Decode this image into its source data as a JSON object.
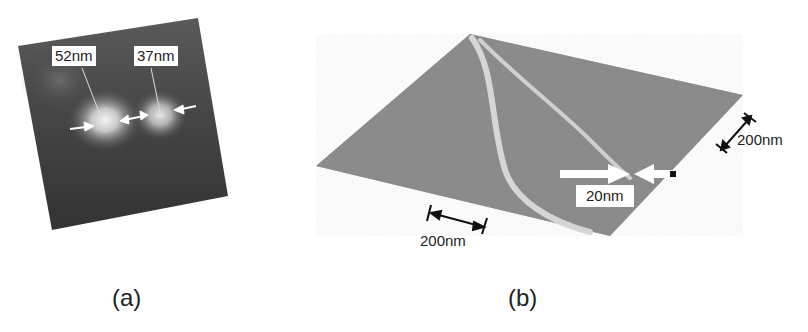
{
  "figure": {
    "panels": [
      {
        "id": "a",
        "caption": "(a)",
        "description": "Dark square micrograph with two bright spots",
        "labels": [
          {
            "text": "52nm"
          },
          {
            "text": "37nm"
          }
        ]
      },
      {
        "id": "b",
        "caption": "(b)",
        "description": "3D surface plot with two curved bright ridges",
        "labels": [
          {
            "text": "20nm"
          },
          {
            "text": "200nm"
          },
          {
            "text": "200nm"
          }
        ]
      }
    ]
  },
  "colors": {
    "background": "#ffffff",
    "panel_a_dark": "#3a3a3a",
    "panel_b_surface": "#8c8c8c",
    "ridge": "#d8d8d8",
    "arrow": "#ffffff",
    "scale_bar": "#111111"
  }
}
